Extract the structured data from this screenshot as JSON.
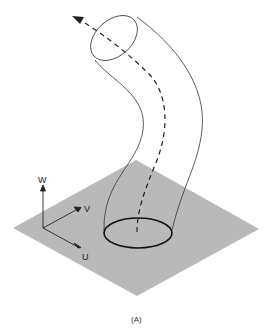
{
  "figure": {
    "caption": "(A)",
    "axes": {
      "w_label": "W",
      "v_label": "V",
      "u_label": "U"
    },
    "colors": {
      "plane": "#b9b9b9",
      "stroke": "#222222",
      "background": "#ffffff"
    },
    "elements": [
      "ground-plane",
      "curved-tube",
      "dashed-center-path",
      "arrowhead",
      "base-ellipse",
      "top-ellipse",
      "uvw-axes"
    ]
  }
}
